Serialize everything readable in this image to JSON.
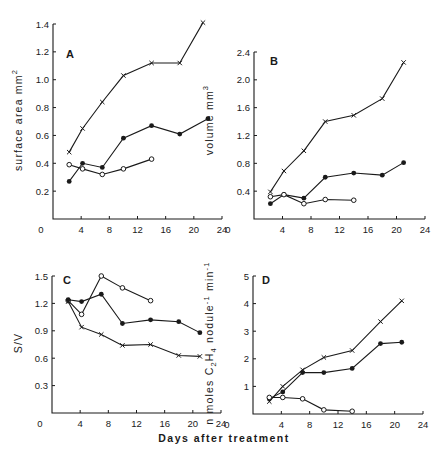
{
  "figure": {
    "shared_xlabel": "Days after treatment"
  },
  "chart_data": [
    {
      "panel": "A",
      "type": "line",
      "ylabel": "surface area mm",
      "ylabel_sup": "2",
      "xlim": [
        0,
        24
      ],
      "ylim": [
        0,
        1.4
      ],
      "xticks": [
        0,
        4,
        8,
        12,
        16,
        20,
        24
      ],
      "xtick_labels": [
        "0",
        "4",
        "8",
        "12",
        "16",
        "20",
        "24"
      ],
      "yticks": [
        0.2,
        0.4,
        0.6,
        0.8,
        1.0,
        1.2,
        1.4
      ],
      "ytick_labels": [
        "0.2",
        "0.4",
        "0.6",
        "0.8",
        "1.0",
        "1.2",
        "1.4"
      ],
      "series": [
        {
          "name": "cross",
          "marker": "x",
          "x": [
            2.3,
            4.2,
            7,
            10,
            14,
            18,
            21.3
          ],
          "y": [
            0.48,
            0.65,
            0.84,
            1.03,
            1.12,
            1.12,
            1.41
          ]
        },
        {
          "name": "filled",
          "marker": "filled-circle",
          "x": [
            2.3,
            4.2,
            7,
            10,
            14,
            18,
            22
          ],
          "y": [
            0.27,
            0.4,
            0.37,
            0.58,
            0.67,
            0.61,
            0.72
          ]
        },
        {
          "name": "open",
          "marker": "open-circle",
          "x": [
            2.3,
            4.2,
            7,
            10,
            14
          ],
          "y": [
            0.39,
            0.36,
            0.32,
            0.36,
            0.43
          ]
        }
      ]
    },
    {
      "panel": "B",
      "type": "line",
      "ylabel": "volume mm",
      "ylabel_sup": "3",
      "xlim": [
        0,
        24
      ],
      "ylim": [
        0,
        2.4
      ],
      "xticks": [
        0,
        4,
        8,
        12,
        16,
        20,
        24
      ],
      "xtick_labels": [
        "0",
        "4",
        "8",
        "12",
        "16",
        "20",
        "24"
      ],
      "yticks": [
        0.4,
        0.8,
        1.2,
        1.6,
        2.0,
        2.4
      ],
      "ytick_labels": [
        "0.4",
        "0.8",
        "1.2",
        "1.6",
        "2.0",
        "2.4"
      ],
      "series": [
        {
          "name": "cross",
          "marker": "x",
          "x": [
            2.3,
            4.2,
            7,
            10,
            14,
            18,
            21
          ],
          "y": [
            0.39,
            0.69,
            0.98,
            1.4,
            1.49,
            1.73,
            2.25
          ]
        },
        {
          "name": "filled",
          "marker": "filled-circle",
          "x": [
            2.3,
            4.2,
            7,
            10,
            14,
            18,
            21
          ],
          "y": [
            0.22,
            0.35,
            0.3,
            0.6,
            0.66,
            0.63,
            0.81
          ]
        },
        {
          "name": "open",
          "marker": "open-circle",
          "x": [
            2.3,
            4.2,
            7,
            10,
            14
          ],
          "y": [
            0.32,
            0.35,
            0.22,
            0.28,
            0.27
          ]
        }
      ]
    },
    {
      "panel": "C",
      "type": "line",
      "ylabel": "S/V",
      "ylabel_sup": "",
      "xlim": [
        0,
        24
      ],
      "ylim": [
        0,
        1.5
      ],
      "xticks": [
        0,
        4,
        8,
        12,
        16,
        20,
        24
      ],
      "xtick_labels": [
        "0",
        "4",
        "8",
        "12",
        "16",
        "20",
        "24"
      ],
      "yticks": [
        0.3,
        0.6,
        0.9,
        1.2,
        1.5
      ],
      "ytick_labels": [
        "0.3",
        "0.6",
        "0.9",
        "1.2",
        "1.5"
      ],
      "series": [
        {
          "name": "open",
          "marker": "open-circle",
          "x": [
            2.3,
            4.2,
            7,
            10,
            14
          ],
          "y": [
            1.23,
            1.08,
            1.5,
            1.37,
            1.23
          ]
        },
        {
          "name": "filled",
          "marker": "filled-circle",
          "x": [
            2.3,
            4.2,
            7,
            10,
            14,
            18,
            21
          ],
          "y": [
            1.24,
            1.22,
            1.3,
            0.98,
            1.02,
            1.0,
            0.88
          ]
        },
        {
          "name": "cross",
          "marker": "x",
          "x": [
            2.3,
            4.2,
            7,
            10,
            14,
            18,
            21
          ],
          "y": [
            1.22,
            0.94,
            0.86,
            0.74,
            0.75,
            0.63,
            0.62
          ]
        }
      ]
    },
    {
      "panel": "D",
      "type": "line",
      "ylabel": "n moles C2H4 nodule-1 min-1",
      "ylabel_sup": "",
      "xlim": [
        0,
        24
      ],
      "ylim": [
        0,
        5
      ],
      "xticks": [
        0,
        4,
        8,
        12,
        16,
        20,
        24
      ],
      "xtick_labels": [
        "0",
        "4",
        "8",
        "12",
        "16",
        "20",
        "24"
      ],
      "yticks": [
        1,
        2,
        3,
        4,
        5
      ],
      "ytick_labels": [
        "1",
        "2",
        "3",
        "4",
        "5"
      ],
      "series": [
        {
          "name": "cross",
          "marker": "x",
          "x": [
            2.3,
            4.2,
            7,
            10,
            14,
            18,
            21
          ],
          "y": [
            0.45,
            1.0,
            1.6,
            2.05,
            2.3,
            3.35,
            4.1
          ]
        },
        {
          "name": "filled",
          "marker": "filled-circle",
          "x": [
            2.3,
            4.2,
            7,
            10,
            14,
            18,
            21
          ],
          "y": [
            0.55,
            0.8,
            1.5,
            1.5,
            1.65,
            2.55,
            2.6
          ]
        },
        {
          "name": "open",
          "marker": "open-circle",
          "x": [
            2.3,
            4.2,
            7,
            10,
            14
          ],
          "y": [
            0.6,
            0.6,
            0.55,
            0.15,
            0.1
          ]
        }
      ]
    }
  ],
  "layout": {
    "panels": [
      {
        "x0": 53,
        "x1": 222,
        "y0": 219,
        "y1": 24,
        "label_x": 66,
        "label_y": 58,
        "ylabel_x": 22,
        "ylabel_y": 120,
        "origin_label_dx": -12
      },
      {
        "x0": 254,
        "x1": 425,
        "y0": 219,
        "y1": 52,
        "label_x": 270,
        "label_y": 65,
        "ylabel_x": 213,
        "ylabel_y": 120,
        "origin_label_dx": -26
      },
      {
        "x0": 52,
        "x1": 221,
        "y0": 413,
        "y1": 276,
        "label_x": 63,
        "label_y": 284,
        "ylabel_x": 22,
        "ylabel_y": 343,
        "origin_label_dx": -12
      },
      {
        "x0": 253,
        "x1": 423,
        "y0": 414,
        "y1": 276,
        "label_x": 262,
        "label_y": 284,
        "ylabel_x": 213,
        "ylabel_y": 343,
        "origin_label_dx": -26
      }
    ]
  }
}
